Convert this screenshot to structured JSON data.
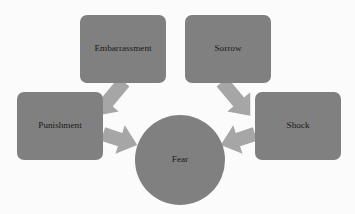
{
  "diagram": {
    "type": "hub-and-spoke",
    "colors": {
      "background": "#fbfbfb",
      "node_fill": "#808080",
      "hub_fill": "#808080",
      "arrow_fill": "#a6a6a6",
      "label_text": "#1a1a1a"
    },
    "hub": {
      "id": "fear",
      "label": "Fear",
      "shape": "circle",
      "cx": 180,
      "cy": 160,
      "r": 45
    },
    "nodes": [
      {
        "id": "embarrassment",
        "label": "Embarrassment",
        "shape": "rounded-rect",
        "x": 80,
        "y": 15,
        "width": 86,
        "height": 68,
        "position": "top-left"
      },
      {
        "id": "sorrow",
        "label": "Sorrow",
        "shape": "rounded-rect",
        "x": 185,
        "y": 15,
        "width": 86,
        "height": 68,
        "position": "top-right"
      },
      {
        "id": "punishment",
        "label": "Punishment",
        "shape": "rounded-rect",
        "x": 17,
        "y": 92,
        "width": 86,
        "height": 68,
        "position": "left"
      },
      {
        "id": "shock",
        "label": "Shock",
        "shape": "rounded-rect",
        "x": 255,
        "y": 92,
        "width": 86,
        "height": 68,
        "position": "right"
      }
    ],
    "arrows": [
      {
        "id": "embarrassment-to-fear",
        "from": "embarrassment",
        "to": "fear",
        "direction": "down-right"
      },
      {
        "id": "sorrow-to-fear",
        "from": "sorrow",
        "to": "fear",
        "direction": "down-left"
      },
      {
        "id": "punishment-to-fear",
        "from": "punishment",
        "to": "fear",
        "direction": "right"
      },
      {
        "id": "shock-to-fear",
        "from": "shock",
        "to": "fear",
        "direction": "left"
      }
    ]
  }
}
